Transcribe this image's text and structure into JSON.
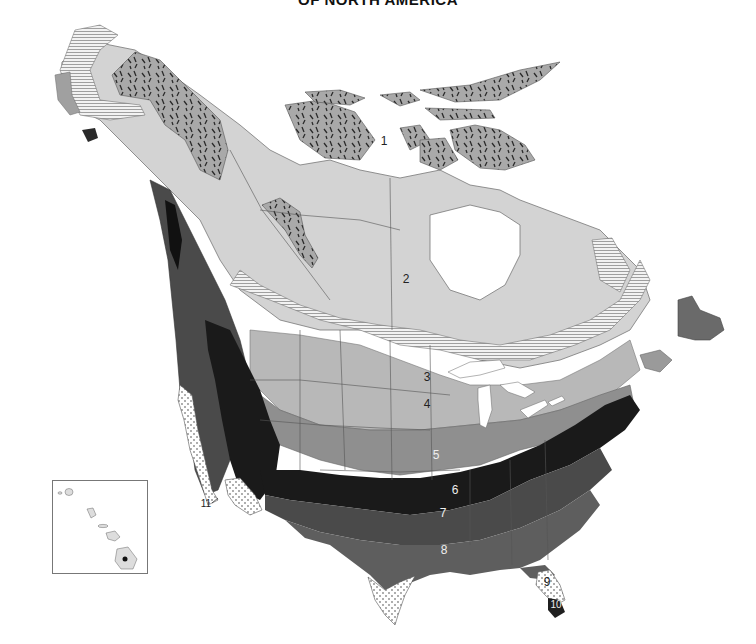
{
  "title": "OF NORTH AMERICA",
  "map": {
    "type": "plant hardiness zone map",
    "region": "North America",
    "colors": {
      "zone1": "#a9a9a9",
      "zone2": "#d3d3d3",
      "zone3": "#ececec",
      "zone4": "#b8b8b8",
      "zone5": "#8f8f8f",
      "zone6": "#1a1a1a",
      "zone7": "#4a4a4a",
      "zone8": "#5e5e5e",
      "zone9": "#ffffff",
      "zone10": "#1f1f1f",
      "zone11": "#ffffff",
      "water": "#ffffff",
      "border": "#555555"
    },
    "zones": [
      {
        "number": "1",
        "pattern": "gray with dark flecks"
      },
      {
        "number": "2",
        "pattern": "light gray solid"
      },
      {
        "number": "3",
        "pattern": "horizontal hatching"
      },
      {
        "number": "4",
        "pattern": "medium-light gray"
      },
      {
        "number": "5",
        "pattern": "medium gray"
      },
      {
        "number": "6",
        "pattern": "black"
      },
      {
        "number": "7",
        "pattern": "dark gray"
      },
      {
        "number": "8",
        "pattern": "dark-medium gray"
      },
      {
        "number": "9",
        "pattern": "white with dots"
      },
      {
        "number": "10",
        "pattern": "black"
      },
      {
        "number": "11",
        "pattern": "white"
      }
    ],
    "labels": [
      {
        "text": "1",
        "x": 384,
        "y": 145,
        "color": "#222"
      },
      {
        "text": "2",
        "x": 406,
        "y": 283,
        "color": "#222"
      },
      {
        "text": "3",
        "x": 427,
        "y": 381,
        "color": "#222"
      },
      {
        "text": "4",
        "x": 427,
        "y": 408,
        "color": "#222"
      },
      {
        "text": "5",
        "x": 436,
        "y": 459,
        "color": "#eee"
      },
      {
        "text": "6",
        "x": 455,
        "y": 494,
        "color": "#eee"
      },
      {
        "text": "7",
        "x": 443,
        "y": 517,
        "color": "#eee"
      },
      {
        "text": "8",
        "x": 444,
        "y": 554,
        "color": "#eee"
      },
      {
        "text": "9",
        "x": 547,
        "y": 586,
        "color": "#222"
      },
      {
        "text": "10",
        "x": 556,
        "y": 608,
        "color": "#eee"
      },
      {
        "text": "11",
        "x": 206,
        "y": 507,
        "color": "#222"
      }
    ]
  },
  "inset": {
    "name": "Hawaii"
  }
}
